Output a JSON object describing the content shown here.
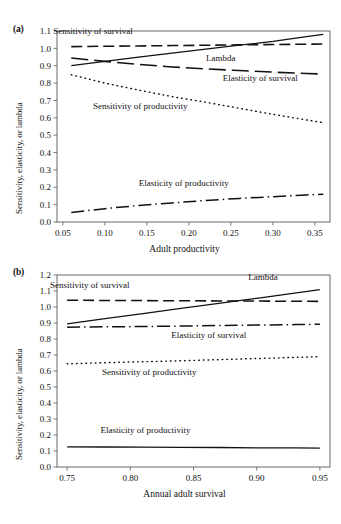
{
  "figure": {
    "background": "#ffffff",
    "ink_color": "#111111",
    "axis_color": "#5a5a5a"
  },
  "panels": [
    {
      "tag": "(a)",
      "chart_data": {
        "type": "line",
        "title": "",
        "xlabel": "Adult productivity",
        "ylabel": "Sensitivity, elasticity, or lambda",
        "xlim": [
          0.043,
          0.368
        ],
        "ylim": [
          0.0,
          1.1
        ],
        "xticks": [
          0.05,
          0.1,
          0.15,
          0.2,
          0.25,
          0.3,
          0.35
        ],
        "xtick_labels": [
          "0.05",
          "0.10",
          "0.15",
          "0.20",
          "0.25",
          "0.30",
          "0.35"
        ],
        "yticks": [
          0.0,
          0.1,
          0.2,
          0.3,
          0.4,
          0.5,
          0.6,
          0.7,
          0.8,
          0.9,
          1.0,
          1.1
        ],
        "ytick_labels": [
          "0.0",
          "0.1",
          "0.2",
          "0.3",
          "0.4",
          "0.5",
          "0.6",
          "0.7",
          "0.8",
          "0.9",
          "1.0",
          "1.1"
        ],
        "grid": false,
        "legend": "inline-annotations",
        "x": [
          0.06,
          0.1,
          0.14,
          0.18,
          0.22,
          0.26,
          0.3,
          0.34,
          0.36
        ],
        "series": [
          {
            "name": "Sensitivity of survival",
            "style": "dashed",
            "values": [
              1.01,
              1.012,
              1.014,
              1.016,
              1.018,
              1.02,
              1.022,
              1.024,
              1.025
            ]
          },
          {
            "name": "Lambda",
            "style": "solid",
            "values": [
              0.9,
              0.925,
              0.95,
              0.972,
              0.995,
              1.018,
              1.04,
              1.068,
              1.08
            ]
          },
          {
            "name": "Elasticity of survival",
            "style": "long-dashed",
            "values": [
              0.945,
              0.925,
              0.908,
              0.893,
              0.882,
              0.872,
              0.863,
              0.855,
              0.852
            ]
          },
          {
            "name": "Sensitivity of productivity",
            "style": "dotted",
            "values": [
              0.848,
              0.8,
              0.76,
              0.722,
              0.69,
              0.655,
              0.62,
              0.588,
              0.572
            ]
          },
          {
            "name": "Elasticity of productivity",
            "style": "dash-dot",
            "values": [
              0.055,
              0.077,
              0.095,
              0.11,
              0.124,
              0.136,
              0.146,
              0.156,
              0.16
            ]
          }
        ],
        "annotations": [
          {
            "text": "Sensitivity of survival",
            "x": 0.086,
            "y": 1.085
          },
          {
            "text": "Lambda",
            "x": 0.238,
            "y": 0.928
          },
          {
            "text": "Elasticity of survival",
            "x": 0.285,
            "y": 0.812
          },
          {
            "text": "Sensitivity of productivity",
            "x": 0.142,
            "y": 0.648
          },
          {
            "text": "Elasticity of productivity",
            "x": 0.194,
            "y": 0.205
          }
        ]
      }
    },
    {
      "tag": "(b)",
      "chart_data": {
        "type": "line",
        "title": "",
        "xlabel": "Annual adult survival",
        "ylabel": "Sensitivity, elasticity, or lambda",
        "xlim": [
          0.742,
          0.958
        ],
        "ylim": [
          0.0,
          1.2
        ],
        "xticks": [
          0.75,
          0.8,
          0.85,
          0.9,
          0.95
        ],
        "xtick_labels": [
          "0.75",
          "0.80",
          "0.85",
          "0.90",
          "0.95"
        ],
        "yticks": [
          0.0,
          0.1,
          0.2,
          0.3,
          0.4,
          0.5,
          0.6,
          0.7,
          0.8,
          0.9,
          1.0,
          1.1,
          1.2
        ],
        "ytick_labels": [
          "0.0",
          "0.1",
          "0.2",
          "0.3",
          "0.4",
          "0.5",
          "0.6",
          "0.7",
          "0.8",
          "0.9",
          "1.0",
          "1.1",
          "1.2"
        ],
        "grid": false,
        "legend": "inline-annotations",
        "x": [
          0.75,
          0.78,
          0.81,
          0.84,
          0.87,
          0.9,
          0.93,
          0.95
        ],
        "series": [
          {
            "name": "Sensitivity of survival",
            "style": "dashed",
            "values": [
              1.042,
              1.041,
              1.04,
              1.039,
              1.038,
              1.037,
              1.036,
              1.035
            ]
          },
          {
            "name": "Lambda",
            "style": "solid",
            "values": [
              0.895,
              0.927,
              0.959,
              0.991,
              1.023,
              1.054,
              1.086,
              1.108
            ]
          },
          {
            "name": "Elasticity of survival",
            "style": "dash-dot",
            "values": [
              0.874,
              0.876,
              0.878,
              0.881,
              0.884,
              0.887,
              0.89,
              0.892
            ]
          },
          {
            "name": "Sensitivity of productivity",
            "style": "dotted",
            "values": [
              0.645,
              0.652,
              0.658,
              0.664,
              0.671,
              0.678,
              0.685,
              0.69
            ]
          },
          {
            "name": "Elasticity of productivity",
            "style": "solid-thin",
            "values": [
              0.126,
              0.125,
              0.124,
              0.123,
              0.122,
              0.12,
              0.119,
              0.118
            ]
          }
        ],
        "annotations": [
          {
            "text": "Sensitivity of survival",
            "x": 0.768,
            "y": 1.118
          },
          {
            "text": "Lambda",
            "x": 0.905,
            "y": 1.168
          },
          {
            "text": "Elasticity of survival",
            "x": 0.862,
            "y": 0.805
          },
          {
            "text": "Sensitivity of productivity",
            "x": 0.815,
            "y": 0.578
          },
          {
            "text": "Elasticity of productivity",
            "x": 0.812,
            "y": 0.21
          }
        ]
      }
    }
  ]
}
